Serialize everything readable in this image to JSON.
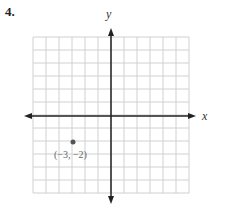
{
  "problem": {
    "number": "4."
  },
  "graph": {
    "x_axis_label": "x",
    "y_axis_label": "y",
    "grid": {
      "columns": 12,
      "rows": 12,
      "x_range": [
        -6,
        6
      ],
      "y_range": [
        -6,
        6
      ]
    },
    "points": [
      {
        "x": -3,
        "y": -2,
        "label": "(−3, −2)"
      }
    ],
    "colors": {
      "grid": "#d0d0d0",
      "axis": "#222222",
      "point": "#555555",
      "label": "#666666"
    }
  }
}
